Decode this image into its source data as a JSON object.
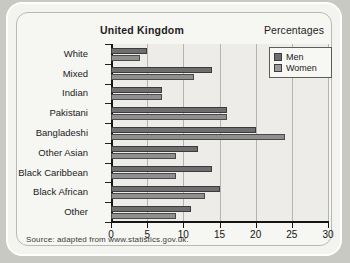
{
  "card": {
    "title": "United Kingdom",
    "unit_label": "Percentages",
    "source": "Source: adapted from www.statistics.gov.uk."
  },
  "legend": {
    "position": "top-right",
    "items": [
      {
        "label": "Men",
        "color": "#6e6e6e",
        "icon": "square-swatch-icon"
      },
      {
        "label": "Women",
        "color": "#9a9a9a",
        "icon": "square-swatch-icon"
      }
    ]
  },
  "chart_data": {
    "type": "bar",
    "orientation": "horizontal",
    "title": "United Kingdom",
    "subtitle": "",
    "xlabel": "Percentages",
    "ylabel": "",
    "xlim": [
      0,
      30
    ],
    "xticks": [
      0,
      5,
      10,
      15,
      20,
      25,
      30
    ],
    "xticklabels": [
      "0",
      "5",
      "10",
      "15",
      "20",
      "25",
      "30"
    ],
    "grid": "vertical",
    "categories": [
      "White",
      "Mixed",
      "Indian",
      "Pakistani",
      "Bangladeshi",
      "Other Asian",
      "Black Caribbean",
      "Black African",
      "Other"
    ],
    "series": [
      {
        "name": "Men",
        "color": "#6e6e6e",
        "values": [
          5,
          14,
          7,
          16,
          20,
          12,
          14,
          15,
          11
        ]
      },
      {
        "name": "Women",
        "color": "#9a9a9a",
        "values": [
          4,
          11.5,
          7,
          16,
          24,
          9,
          9,
          13,
          9
        ]
      }
    ],
    "annotations": [
      "Source: adapted from www.statistics.gov.uk."
    ]
  }
}
